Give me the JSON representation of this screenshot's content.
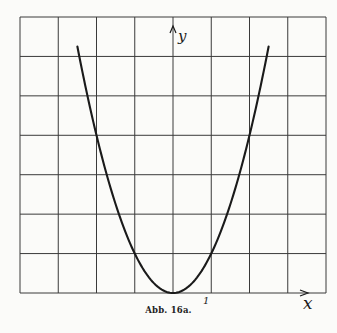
{
  "chart_data": {
    "type": "line",
    "title": "",
    "caption": "Abb. 16a.",
    "xlabel": "x",
    "ylabel": "y",
    "function": "y = x^2",
    "x_tick_labels": [
      {
        "value": 1,
        "label": "1"
      }
    ],
    "xlim": [
      -4,
      4
    ],
    "ylim": [
      0,
      7
    ],
    "grid": true,
    "grid_columns": 8,
    "grid_rows": 7,
    "series": [
      {
        "name": "y = x^2",
        "x": [
          -2.5,
          -2.0,
          -1.5,
          -1.0,
          -0.5,
          0.0,
          0.5,
          1.0,
          1.5,
          2.0,
          2.5
        ],
        "y": [
          6.25,
          4.0,
          2.25,
          1.0,
          0.25,
          0.0,
          0.25,
          1.0,
          2.25,
          4.0,
          6.25
        ]
      }
    ],
    "colors": {
      "curve": "#1a1a1a",
      "grid": "#3a3a3a",
      "background": "#fbfbf9"
    }
  },
  "figure": {
    "caption": "Abb. 16a.",
    "x_axis_label": "x",
    "y_axis_label": "y",
    "tick_one_label": "1"
  }
}
